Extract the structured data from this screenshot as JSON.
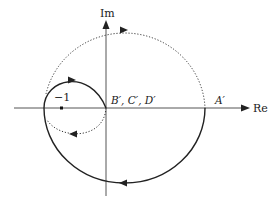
{
  "diagram": {
    "type": "nyquist-plot",
    "axes": {
      "real_label": "Re",
      "imag_label": "Im"
    },
    "points": {
      "minus_one": "−1",
      "origin_label": "B′, C′, D′",
      "a_prime": "A′"
    },
    "curves": [
      {
        "name": "outer-solid-path",
        "style": "solid",
        "description": "From A' down clockwise through bottom to left crossing, then loop up and back to origin"
      },
      {
        "name": "outer-dotted-path",
        "style": "dotted",
        "description": "From left crossing over the top to A'"
      },
      {
        "name": "inner-dotted-loop",
        "style": "dotted",
        "description": "From origin down-left back to left crossing"
      }
    ],
    "colors": {
      "line": "#222222",
      "axis": "#666666"
    }
  }
}
